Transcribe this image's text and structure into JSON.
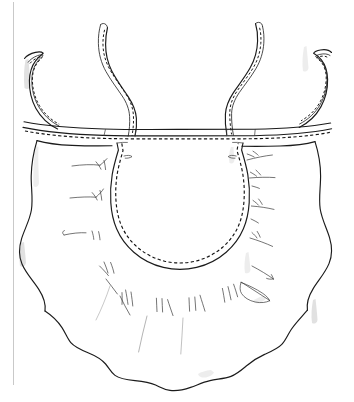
{
  "figure": {
    "title": "Gathered apron construction diagram",
    "kind": "line-art-technical-illustration",
    "caption": "",
    "background_color": "#ffffff",
    "ink_color": "#1b1b1b",
    "stitch_color": "#141414",
    "smudge_color": "#9c9c9c",
    "page_rule_color": "#c9c9c9",
    "canvas": {
      "width": 354,
      "height": 402
    }
  },
  "parts": [
    {
      "id": "page-edge",
      "name": "page-edge-rule",
      "label": "Scanned page edge",
      "description": "Faint vertical gray scan line along the left margin"
    },
    {
      "id": "tie-outer-left",
      "name": "tie-strap-outer-left",
      "label": "Outer left tie",
      "description": "Short hook-shaped tie rising from the left end of the waistband",
      "has_topstitch": true
    },
    {
      "id": "tie-inner-left",
      "name": "tie-strap-inner-left",
      "label": "Inner left tie",
      "description": "Tall S-curved tie rising from the left of center",
      "has_topstitch": true
    },
    {
      "id": "tie-inner-right",
      "name": "tie-strap-inner-right",
      "label": "Inner right tie",
      "description": "Tall S-curved tie rising from the right of center",
      "has_topstitch": true
    },
    {
      "id": "tie-outer-right",
      "name": "tie-strap-outer-right",
      "label": "Outer right tie",
      "description": "Short hook-shaped tie rising from the right end of the waistband",
      "has_topstitch": true
    },
    {
      "id": "waistband",
      "name": "waistband",
      "label": "Waistband",
      "description": "Horizontal band spanning the full width with a dashed topstitch line along its lower edge",
      "has_topstitch": true
    },
    {
      "id": "skirt",
      "name": "skirt-panel",
      "label": "Gathered skirt",
      "description": "Wide gathered skirt below the waistband with wavy side edges and a scalloped hem",
      "has_topstitch": false
    },
    {
      "id": "center-panel",
      "name": "center-panel-seam",
      "label": "U-shaped center panel",
      "description": "Topstitched U-shaped seam in the middle of the skirt, outlined in solid ink with a parallel dashed stitch line",
      "has_topstitch": true
    },
    {
      "id": "gather-marks",
      "name": "gathering-marks",
      "label": "Gathering marks",
      "description": "Short radiating hatch strokes along the outside of the U-seam indicating gathered fabric",
      "has_topstitch": false
    },
    {
      "id": "hem",
      "name": "scalloped-hem",
      "label": "Scalloped hem",
      "description": "Undulating lower edge of the skirt",
      "has_topstitch": false
    }
  ]
}
